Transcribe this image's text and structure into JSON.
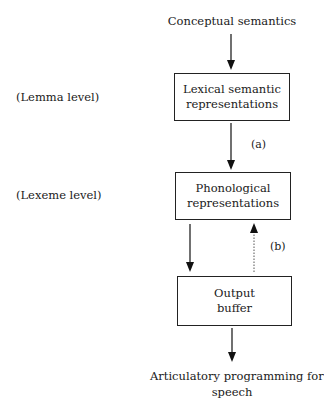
{
  "diagram": {
    "type": "flowchart",
    "top_input": "Conceptual semantics",
    "levels": [
      {
        "label": "(Lemma level)"
      },
      {
        "label": "(Lexeme level)"
      }
    ],
    "boxes": [
      {
        "id": "lexical",
        "lines": [
          "Lexical semantic",
          "representations"
        ]
      },
      {
        "id": "phonological",
        "lines": [
          "Phonological",
          "representations"
        ]
      },
      {
        "id": "buffer",
        "lines": [
          "Output",
          "buffer"
        ]
      }
    ],
    "arrow_labels": {
      "a": "(a)",
      "b": "(b)"
    },
    "bottom_output": [
      "Articulatory programming for",
      "speech"
    ],
    "edges": [
      {
        "from": "Conceptual semantics",
        "to": "lexical",
        "style": "solid"
      },
      {
        "from": "lexical",
        "to": "phonological",
        "style": "solid",
        "label": "(a)"
      },
      {
        "from": "phonological",
        "to": "buffer",
        "style": "solid"
      },
      {
        "from": "buffer",
        "to": "phonological",
        "style": "dotted",
        "label": "(b)"
      },
      {
        "from": "buffer",
        "to": "Articulatory programming for speech",
        "style": "solid"
      }
    ]
  }
}
